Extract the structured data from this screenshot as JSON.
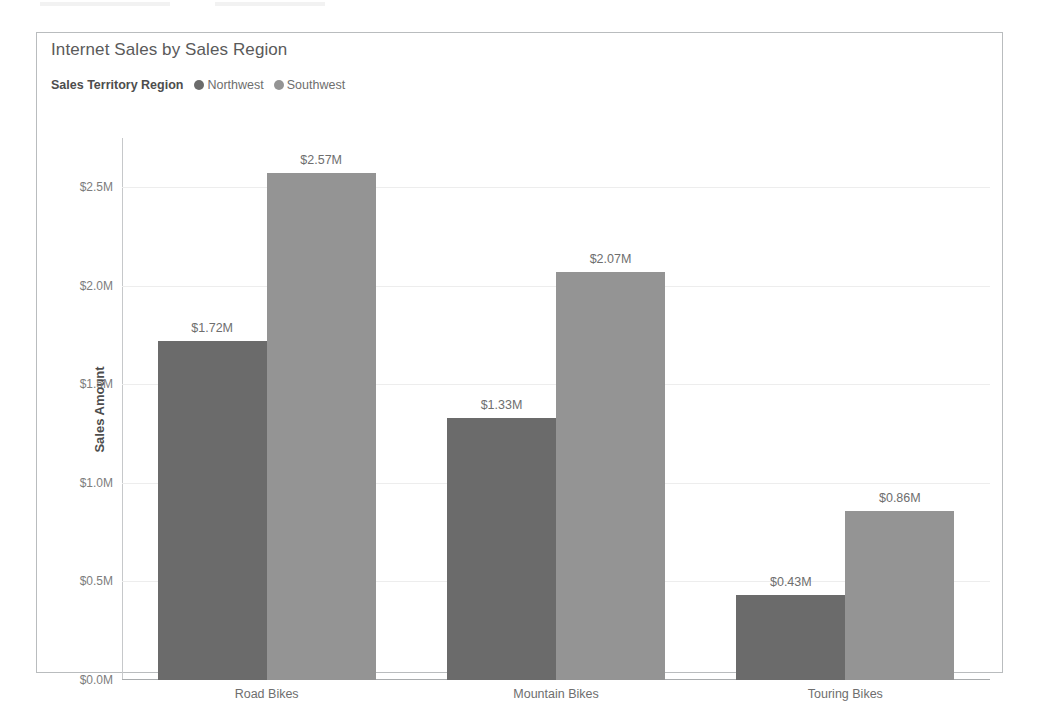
{
  "card": {
    "border_color": "#b9bcbe"
  },
  "chart_data": {
    "type": "bar",
    "title": "Internet Sales by Sales Region",
    "xlabel": "",
    "ylabel": "Sales Amount",
    "categories": [
      "Road Bikes",
      "Mountain Bikes",
      "Touring Bikes"
    ],
    "series": [
      {
        "name": "Northwest",
        "color": "#6b6b6b",
        "values": [
          1.72,
          1.33,
          0.43
        ],
        "labels": [
          "$1.72M",
          "$1.33M",
          "$0.43M"
        ]
      },
      {
        "name": "Southwest",
        "color": "#949494",
        "values": [
          2.57,
          2.07,
          0.86
        ],
        "labels": [
          "$2.57M",
          "$2.07M",
          "$0.86M"
        ]
      }
    ],
    "ylim": [
      0,
      2.75
    ],
    "yticks": [
      0.0,
      0.5,
      1.0,
      1.5,
      2.0,
      2.5
    ],
    "ytick_labels": [
      "$0.0M",
      "$0.5M",
      "$1.0M",
      "$1.5M",
      "$2.0M",
      "$2.5M"
    ],
    "grid": true,
    "legend_position": "top-left",
    "legend_title": "Sales Territory Region"
  }
}
